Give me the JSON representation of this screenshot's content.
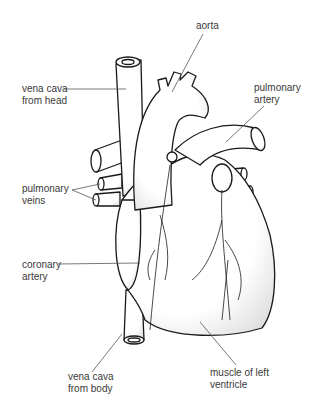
{
  "diagram": {
    "labels": {
      "aorta": "aorta",
      "vena_cava_head": "vena cava\nfrom head",
      "pulmonary_artery": "pulmonary\nartery",
      "pulmonary_veins": "pulmonary\nveins",
      "coronary_artery": "coronary\nartery",
      "vena_cava_body": "vena cava\nfrom body",
      "muscle_left_ventricle": "muscle of left\nventricle"
    },
    "colors": {
      "line": "#1a1a1a",
      "text": "#3a3a3a",
      "leader": "#555555",
      "background": "#ffffff"
    }
  }
}
